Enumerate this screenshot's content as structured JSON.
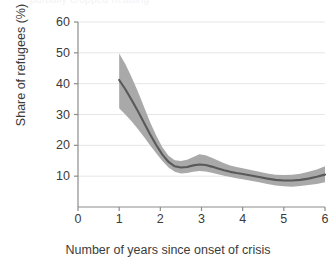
{
  "chart_data": {
    "type": "line",
    "title": "",
    "xlabel": "Number of years since onset of crisis",
    "ylabel": "Share of refugees (%)",
    "xlim": [
      0,
      6
    ],
    "ylim": [
      0,
      60
    ],
    "xticks": [
      "0",
      "1",
      "2",
      "3",
      "4",
      "5",
      "6"
    ],
    "yticks": [
      "10",
      "20",
      "30",
      "40",
      "50",
      "60"
    ],
    "grid": "horizontal",
    "legend": "none",
    "colors": {
      "line": "#595959",
      "band": "#a9a9a9",
      "grid": "#e6e6e6",
      "axis": "#8c8c8c",
      "text": "#3b3b3b",
      "background": "#ffffff"
    },
    "series": [
      {
        "name": "Share of refugees",
        "x": [
          1.0,
          1.15,
          1.3,
          1.45,
          1.6,
          1.75,
          1.9,
          2.05,
          2.2,
          2.35,
          2.5,
          2.65,
          2.8,
          2.95,
          3.1,
          3.25,
          3.4,
          3.55,
          3.7,
          3.85,
          4.0,
          4.2,
          4.4,
          4.6,
          4.8,
          5.0,
          5.2,
          5.4,
          5.6,
          5.8,
          6.0
        ],
        "values": [
          41.2,
          38.2,
          34.8,
          31.2,
          27.4,
          23.6,
          20.1,
          17.0,
          14.6,
          13.2,
          12.8,
          13.0,
          13.5,
          13.8,
          13.6,
          13.1,
          12.5,
          11.9,
          11.4,
          11.0,
          10.7,
          10.2,
          9.7,
          9.2,
          8.8,
          8.6,
          8.6,
          8.8,
          9.2,
          9.8,
          10.5
        ],
        "band_low": [
          32.0,
          30.0,
          27.8,
          25.4,
          22.8,
          20.0,
          17.4,
          14.9,
          12.8,
          11.4,
          10.9,
          11.0,
          11.4,
          11.7,
          11.5,
          11.1,
          10.6,
          10.1,
          9.7,
          9.3,
          9.0,
          8.5,
          8.0,
          7.5,
          7.0,
          6.7,
          6.6,
          6.8,
          7.1,
          7.5,
          8.0
        ],
        "band_high": [
          49.8,
          46.4,
          42.2,
          37.6,
          32.6,
          27.6,
          23.2,
          19.4,
          16.6,
          15.2,
          14.9,
          15.3,
          16.2,
          17.1,
          16.8,
          16.0,
          15.1,
          14.2,
          13.5,
          13.0,
          12.6,
          12.0,
          11.4,
          10.9,
          10.5,
          10.4,
          10.5,
          10.8,
          11.4,
          12.2,
          13.2
        ]
      }
    ]
  },
  "axis": {
    "y_title": "Share of refugees (%)",
    "x_title": "Number of years since onset of crisis"
  },
  "clipped_header": {
    "text": "partially cropped heading"
  }
}
